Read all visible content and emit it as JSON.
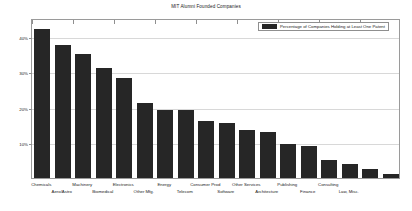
{
  "chart_data": {
    "type": "bar",
    "title": "MIT Alumni Founded Companies",
    "xlabel": "",
    "ylabel": "",
    "ylim": [
      0,
      45
    ],
    "grid": true,
    "legend_position": "top-right",
    "bar_color": "#262626",
    "ytick_labels": [
      "10%",
      "20%",
      "30%",
      "40%"
    ],
    "ytick_values": [
      10,
      20,
      30,
      40
    ],
    "categories": [
      "Chemicals",
      "Aero/Astro",
      "Machinery",
      "Biomedical",
      "Electronics",
      "Other Mfg.",
      "Energy",
      "Telecom",
      "Consumer Prod",
      "Software",
      "Other Services",
      "Architecture",
      "Publishing",
      "Finance",
      "Consulting",
      "Law, Misc.",
      "",
      ""
    ],
    "series": [
      {
        "name": "Percentage of Companies Holding at Least One Patent",
        "values": [
          42,
          37.5,
          35,
          31,
          28,
          21,
          19,
          19,
          16,
          15.5,
          13.5,
          13,
          9.5,
          9,
          5,
          4,
          2.5,
          1.2
        ]
      }
    ],
    "legend": [
      "Percentage of Companies Holding at Least One Patent"
    ]
  }
}
